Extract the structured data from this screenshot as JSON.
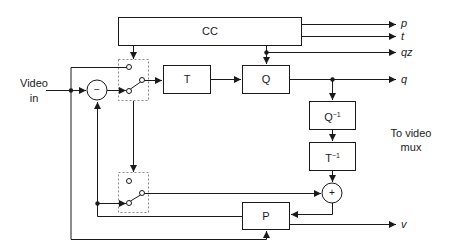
{
  "diagram": {
    "type": "block-diagram",
    "title": "",
    "colors": {
      "line": "#1a1a1a",
      "dashed": "#888888",
      "background": "#ffffff"
    },
    "input": {
      "label_line1": "Video",
      "label_line2": "in"
    },
    "blocks": {
      "cc": {
        "label": "CC"
      },
      "t": {
        "label": "T"
      },
      "q": {
        "label": "Q"
      },
      "q_inv": {
        "label": "Q",
        "sup": "−1"
      },
      "t_inv": {
        "label": "T",
        "sup": "−1"
      },
      "p": {
        "label": "P"
      }
    },
    "operators": {
      "subtract": {
        "symbol": "−"
      },
      "add": {
        "symbol": "+"
      }
    },
    "outputs": {
      "p": "p",
      "t": "t",
      "qz": "qz",
      "q": "q",
      "v": "v"
    },
    "annotation": {
      "line1": "To video",
      "line2": "mux"
    }
  }
}
